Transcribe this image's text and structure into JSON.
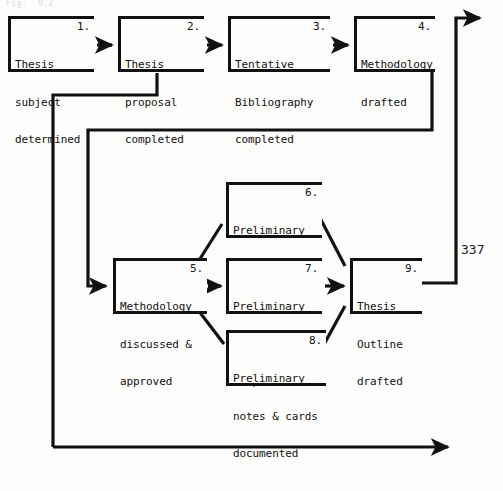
{
  "page": {
    "width": 503,
    "height": 491,
    "background_color": "#fdfdfb",
    "ink_color": "#111111",
    "header_faint_text": "Fig.  9.2",
    "page_number": "337"
  },
  "diagram": {
    "type": "flowchart",
    "nodes": [
      {
        "id": "n1",
        "number": "1.",
        "lines": [
          "Thesis",
          "subject",
          "determined"
        ],
        "x": 8,
        "y": 16,
        "w": 86,
        "h": 56
      },
      {
        "id": "n2",
        "number": "2.",
        "lines": [
          "Thesis",
          "proposal",
          "completed"
        ],
        "x": 118,
        "y": 16,
        "w": 86,
        "h": 56
      },
      {
        "id": "n3",
        "number": "3.",
        "lines": [
          "Tentative",
          "Bibliography",
          "completed"
        ],
        "x": 228,
        "y": 16,
        "w": 102,
        "h": 56
      },
      {
        "id": "n4",
        "number": "4.",
        "lines": [
          "Methodology",
          "drafted"
        ],
        "x": 354,
        "y": 16,
        "w": 81,
        "h": 56
      },
      {
        "id": "n5",
        "number": "5.",
        "lines": [
          "Methodology",
          "discussed &",
          "approved"
        ],
        "x": 113,
        "y": 258,
        "w": 94,
        "h": 56
      },
      {
        "id": "n6",
        "number": "6.",
        "lines": [
          "Preliminary",
          "interviewing",
          "completed"
        ],
        "x": 226,
        "y": 182,
        "w": 96,
        "h": 56
      },
      {
        "id": "n7",
        "number": "7.",
        "lines": [
          "Preliminary",
          "reading",
          "completed"
        ],
        "x": 226,
        "y": 258,
        "w": 96,
        "h": 56
      },
      {
        "id": "n8",
        "number": "8.",
        "lines": [
          "Preliminary",
          "notes & cards",
          "documented"
        ],
        "x": 226,
        "y": 330,
        "w": 100,
        "h": 56
      },
      {
        "id": "n9",
        "number": "9.",
        "lines": [
          "Thesis",
          "Outline",
          "drafted"
        ],
        "x": 350,
        "y": 258,
        "w": 72,
        "h": 56
      }
    ],
    "connectors": [
      {
        "id": "c1",
        "from": "n1",
        "to": "n2",
        "kind": "arrow-right"
      },
      {
        "id": "c2",
        "from": "n2",
        "to": "n3",
        "kind": "arrow-right"
      },
      {
        "id": "c3",
        "from": "n3",
        "to": "n4",
        "kind": "arrow-right"
      },
      {
        "id": "c4",
        "from": "n2",
        "to": "n5",
        "kind": "elbow-down-left-arrow"
      },
      {
        "id": "c5",
        "from": "n4",
        "to": "n5",
        "kind": "elbow-loop-arrow"
      },
      {
        "id": "c6",
        "from": "n5",
        "to": "n6",
        "kind": "diagonal"
      },
      {
        "id": "c7",
        "from": "n5",
        "to": "n7",
        "kind": "arrow-right"
      },
      {
        "id": "c8",
        "from": "n5",
        "to": "n8",
        "kind": "diagonal"
      },
      {
        "id": "c9",
        "from": "n6",
        "to": "n9",
        "kind": "diagonal"
      },
      {
        "id": "c10",
        "from": "n7",
        "to": "n9",
        "kind": "arrow-right"
      },
      {
        "id": "c11",
        "from": "n8",
        "to": "n9",
        "kind": "diagonal"
      },
      {
        "id": "c12",
        "from": "n9",
        "to": "top-right-exit",
        "kind": "elbow-up-arrow"
      },
      {
        "id": "c13",
        "from": "left-spine",
        "to": "bottom-right-exit",
        "kind": "elbow-down-arrow"
      }
    ]
  }
}
